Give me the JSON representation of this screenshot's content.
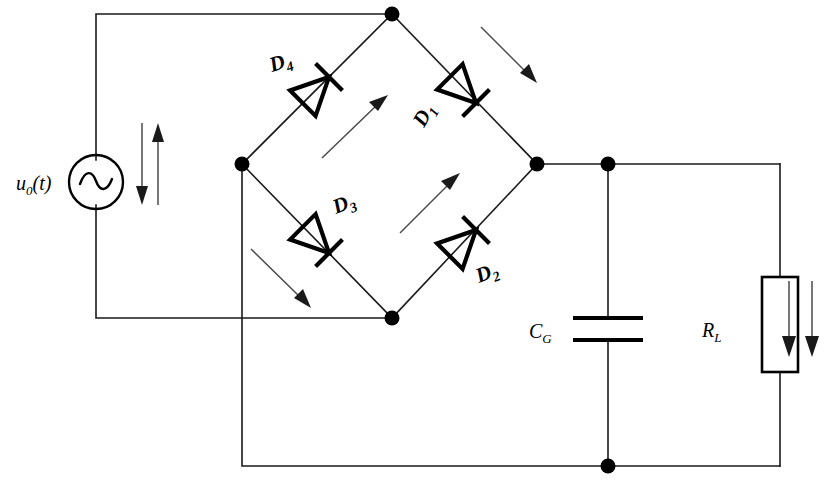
{
  "diagram": {
    "type": "circuit-schematic",
    "background_color": "#ffffff",
    "line_color": "#1a1a1a",
    "arrow_color": "#4a4a4a"
  },
  "source": {
    "label_main": "u",
    "label_sub": "0",
    "label_arg": "(t)",
    "symbol": "ac-voltage-source",
    "waveform_glyph": "sine"
  },
  "diodes": [
    {
      "id": "D1",
      "label_main": "D",
      "label_sub": "1",
      "direction": "down-right",
      "position": "bridge-top-right"
    },
    {
      "id": "D2",
      "label_main": "D",
      "label_sub": "2",
      "direction": "up-right",
      "position": "bridge-bottom-right"
    },
    {
      "id": "D3",
      "label_main": "D",
      "label_sub": "3",
      "direction": "down-right",
      "position": "bridge-bottom-left"
    },
    {
      "id": "D4",
      "label_main": "D",
      "label_sub": "4",
      "direction": "up-right",
      "position": "bridge-top-left"
    }
  ],
  "capacitor": {
    "label_main": "C",
    "label_sub": "G",
    "symbol": "capacitor-parallel-plates"
  },
  "resistor": {
    "label_main": "R",
    "label_sub": "L",
    "symbol": "resistor-box"
  },
  "current_arrows": [
    {
      "name": "source-arrow-down",
      "direction": "down"
    },
    {
      "name": "source-arrow-up",
      "direction": "up"
    },
    {
      "name": "bridge-arrow-upper-left",
      "direction": "up-right"
    },
    {
      "name": "bridge-arrow-upper-right",
      "direction": "down-right"
    },
    {
      "name": "bridge-arrow-lower-left",
      "direction": "down-right"
    },
    {
      "name": "bridge-arrow-lower-right",
      "direction": "up-right"
    },
    {
      "name": "load-arrow-left",
      "direction": "down"
    },
    {
      "name": "load-arrow-right",
      "direction": "down"
    }
  ],
  "nodes": [
    {
      "name": "bridge-top-node",
      "x": 392,
      "y": 14
    },
    {
      "name": "bridge-left-node",
      "x": 242,
      "y": 164
    },
    {
      "name": "bridge-right-node",
      "x": 537,
      "y": 164
    },
    {
      "name": "bridge-bottom-node",
      "x": 392,
      "y": 318
    },
    {
      "name": "capacitor-top-node",
      "x": 608,
      "y": 164
    },
    {
      "name": "capacitor-bottom-node",
      "x": 608,
      "y": 466
    }
  ]
}
